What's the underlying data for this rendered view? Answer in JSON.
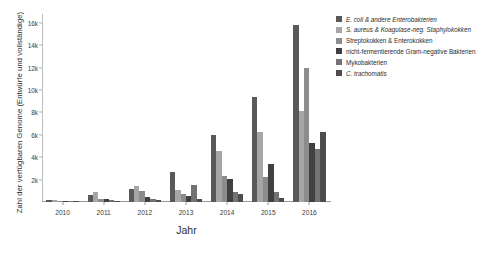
{
  "chart_data": {
    "type": "bar",
    "title": "",
    "xlabel": "Jahr",
    "ylabel": "Zahl der verfügbaren Genome (Entwürfe und vollständige)",
    "categories": [
      "2010",
      "2011",
      "2012",
      "2013",
      "2014",
      "2015",
      "2016"
    ],
    "ylim": [
      0,
      16800
    ],
    "yticks": [
      2000,
      4000,
      6000,
      8000,
      10000,
      12000,
      14000,
      16000
    ],
    "ytick_labels": [
      "2k",
      "4k",
      "6k",
      "8k",
      "10k",
      "12k",
      "14k",
      "16k"
    ],
    "grid": false,
    "legend_position": "right",
    "series": [
      {
        "name": "E. coli & andere Enterobakterien",
        "color": "#595959",
        "values": [
          180,
          640,
          1150,
          2700,
          6000,
          9400,
          15800
        ]
      },
      {
        "name": "S. aureus & Koagulase-neg. Staphylokokken",
        "color": "#a6a6a6",
        "values": [
          140,
          900,
          1450,
          1050,
          4600,
          6250,
          8150
        ]
      },
      {
        "name": "Streptokokken & Enterokokken",
        "color": "#8c8c8c",
        "values": [
          110,
          300,
          950,
          700,
          2300,
          2250,
          12000
        ]
      },
      {
        "name": "nicht-fermentierende Gram-negative Bakterien",
        "color": "#404040",
        "values": [
          90,
          230,
          420,
          500,
          2050,
          3400,
          5300
        ]
      },
      {
        "name": "Mykobakterien",
        "color": "#737373",
        "values": [
          60,
          140,
          300,
          1500,
          900,
          900,
          4750
        ]
      },
      {
        "name": "C. trachomatis",
        "color": "#4d4d4d",
        "values": [
          40,
          90,
          180,
          260,
          700,
          400,
          6250
        ]
      }
    ]
  },
  "axis": {
    "y_title": "Zahl der verfügbaren Genome (Entwürfe und vollständige)",
    "x_title": "Jahr"
  }
}
